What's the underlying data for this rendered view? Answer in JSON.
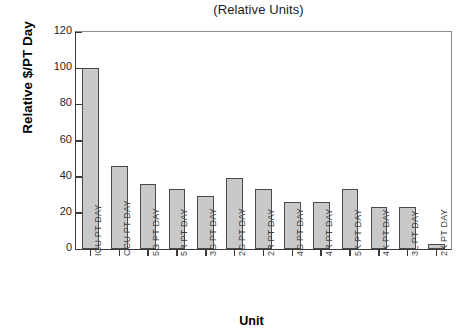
{
  "chart_data": {
    "type": "bar",
    "title": "(Relative Units)",
    "xlabel": "Unit",
    "ylabel": "Relative $/PT Day",
    "categories": [
      "ICU PT DAY",
      "CCU PT DAY",
      "5G PT DAY",
      "5R PT DAY",
      "3G PT DAY",
      "2G PT DAY",
      "2R PT DAY",
      "4G PT DAY",
      "4R PT DAY",
      "5K PT DAY",
      "4K PT DAY",
      "3L PT DAY",
      "2K PT DAY"
    ],
    "values": [
      100,
      46,
      36,
      33,
      29.5,
      39.5,
      33,
      26,
      26,
      33,
      23.5,
      23.5,
      3
    ],
    "ylim": [
      0,
      120
    ],
    "yticks": [
      0,
      20,
      40,
      60,
      80,
      100,
      120
    ],
    "ytick_labels": [
      "0",
      "20",
      "40",
      "60",
      "80",
      "100",
      "120"
    ],
    "grid": false,
    "legend": false,
    "bar_color": "#c9c9c9",
    "bar_border_color": "#4a4a4a",
    "axis_color": "#3a3a3a"
  }
}
